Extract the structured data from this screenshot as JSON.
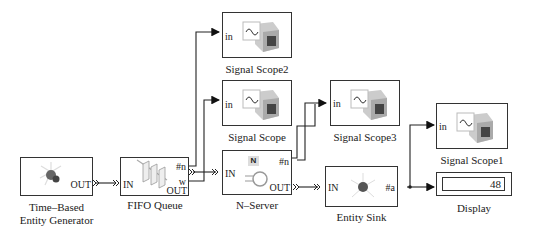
{
  "blocks": {
    "generator": {
      "label_line1": "Time–Based",
      "label_line2": "Entity Generator",
      "out_port": "OUT"
    },
    "fifo": {
      "label": "FIFO Queue",
      "in_port": "IN",
      "n_port": "#n",
      "w_port": "w",
      "out_port": "OUT"
    },
    "scope2": {
      "label": "Signal Scope2",
      "in_port": "in"
    },
    "scope": {
      "label": "Signal Scope",
      "in_port": "in"
    },
    "server": {
      "label": "N–Server",
      "in_port": "IN",
      "n_port": "#n",
      "out_port": "OUT",
      "icon_letter": "N"
    },
    "scope3": {
      "label": "Signal Scope3",
      "in_port": "in"
    },
    "sink": {
      "label": "Entity Sink",
      "in_port": "IN",
      "a_port": "#a"
    },
    "scope1": {
      "label": "Signal Scope1",
      "in_port": "in"
    },
    "display": {
      "label": "Display",
      "value": "48"
    }
  }
}
